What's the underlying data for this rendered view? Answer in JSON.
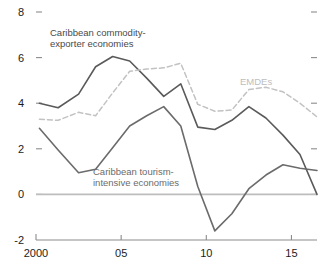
{
  "chart_data": {
    "type": "line",
    "title": "",
    "subtitle": "",
    "xlabel": "",
    "ylabel": "",
    "xlim": [
      2000,
      2016.5
    ],
    "ylim": [
      -2,
      8
    ],
    "yticks": [
      -2,
      0,
      2,
      4,
      6,
      8
    ],
    "ytick_labels": [
      "-2",
      "0",
      "2",
      "4",
      "6",
      "8"
    ],
    "xticks": [
      2000,
      2005,
      2010,
      2015
    ],
    "xtick_labels": [
      "2000",
      "05",
      "10",
      "15"
    ],
    "grid": false,
    "legend_position": "inline-annotations",
    "zero_line": 0,
    "series": [
      {
        "name": "Caribbean commodity-exporter economies",
        "color": "#5a5a5a",
        "style": "solid",
        "x": [
          2000.2,
          2001.3,
          2002.5,
          2003.5,
          2004.5,
          2005.5,
          2006.5,
          2007.5,
          2008.5,
          2009.5,
          2010.5,
          2011.5,
          2012.5,
          2013.5,
          2014.5,
          2015.5,
          2016.5
        ],
        "values": [
          4.0,
          3.8,
          4.4,
          5.6,
          6.05,
          5.85,
          5.1,
          4.3,
          4.85,
          2.95,
          2.85,
          3.25,
          3.85,
          3.35,
          2.6,
          1.75,
          0.0
        ]
      },
      {
        "name": "Caribbean tourism-intensive economies",
        "color": "#6b6b6b",
        "style": "solid",
        "x": [
          2000.2,
          2001.3,
          2002.5,
          2003.5,
          2004.5,
          2005.5,
          2006.5,
          2007.5,
          2008.5,
          2009.5,
          2010.5,
          2011.5,
          2012.5,
          2013.5,
          2014.5,
          2015.5,
          2016.5
        ],
        "values": [
          2.9,
          1.95,
          0.95,
          1.1,
          2.05,
          3.0,
          3.45,
          3.85,
          3.0,
          0.35,
          -1.6,
          -0.85,
          0.25,
          0.85,
          1.3,
          1.15,
          1.05
        ]
      },
      {
        "name": "EMDEs",
        "color": "#c2c2c2",
        "style": "dashed",
        "x": [
          2000.2,
          2001.3,
          2002.5,
          2003.5,
          2004.5,
          2005.5,
          2006.5,
          2007.5,
          2008.5,
          2009.5,
          2010.5,
          2011.5,
          2012.5,
          2013.5,
          2014.5,
          2015.5,
          2016.5
        ],
        "values": [
          3.3,
          3.25,
          3.6,
          3.45,
          4.45,
          5.4,
          5.5,
          5.55,
          5.75,
          3.95,
          3.65,
          3.7,
          4.6,
          4.7,
          4.5,
          4.0,
          3.4
        ]
      }
    ],
    "annotations": [
      {
        "name": "commodity-exporter-label",
        "lines": [
          "Caribbean commodity-",
          "exporter economies"
        ],
        "x": 50,
        "y": 36,
        "color": "#4a4a4a"
      },
      {
        "name": "tourism-intensive-label",
        "lines": [
          "Caribbean tourism-",
          "intensive economies"
        ],
        "x": 93,
        "y": 175,
        "color": "#6b6b6b"
      },
      {
        "name": "emdes-label",
        "lines": [
          "EMDEs"
        ],
        "x": 240,
        "y": 85,
        "color": "#bdbdbd"
      }
    ],
    "axis_color": "#8c8c8c",
    "zero_line_color": "#bdbdbd",
    "background": "#ffffff"
  }
}
